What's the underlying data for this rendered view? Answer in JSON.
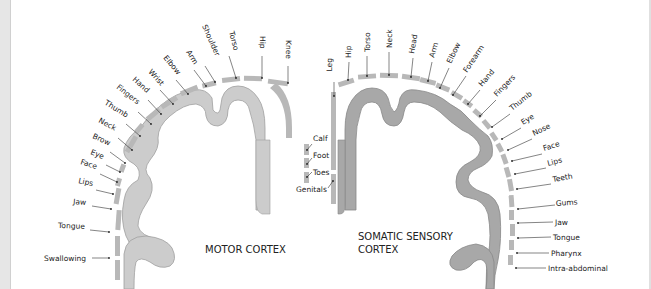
{
  "colors": {
    "background": "#ffffff",
    "motor_cortex_fill": "#cccccc",
    "sensory_cortex_fill": "#a8a8a8",
    "segment_fill": "#b8b8b8",
    "outline": "#999999",
    "text": "#222222",
    "left_strip": "#e6e6e6"
  },
  "motor_cortex": {
    "title": "MOTOR CORTEX",
    "labels": [
      "Knee",
      "Hip",
      "Torso",
      "Shoulder",
      "Arm",
      "Elbow",
      "Wrist",
      "Hand",
      "Fingers",
      "Thumb",
      "Neck",
      "Brow",
      "Eye",
      "Face",
      "Lips",
      "Jaw",
      "Tongue",
      "Swallowing"
    ],
    "medial_labels": [
      "Calf",
      "Foot",
      "Toes"
    ]
  },
  "sensory_cortex": {
    "title_line1": "SOMATIC SENSORY",
    "title_line2": "CORTEX",
    "labels": [
      "Hip",
      "Torso",
      "Neck",
      "Head",
      "Arm",
      "Elbow",
      "Forearm",
      "Hand",
      "Fingers",
      "Thumb",
      "Eye",
      "Nose",
      "Face",
      "Lips",
      "Teeth",
      "Gums",
      "Jaw",
      "Tongue",
      "Pharynx",
      "Intra-abdominal"
    ],
    "medial_labels": [
      "Leg",
      "Genitals"
    ]
  }
}
